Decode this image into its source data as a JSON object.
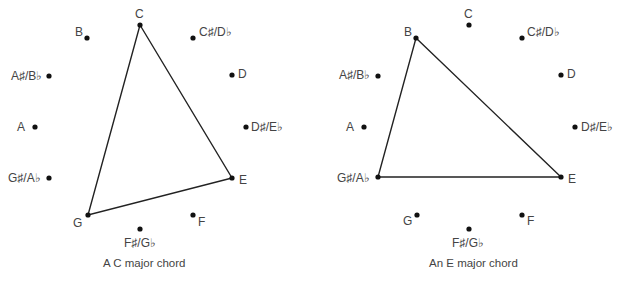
{
  "diagrams": [
    {
      "caption": "A C major chord",
      "chord_root": "C",
      "chord_notes": [
        "C",
        "E",
        "G"
      ],
      "notes": [
        {
          "label": "C",
          "x": 140,
          "y": 25
        },
        {
          "label": "C♯/D♭",
          "x": 193,
          "y": 38
        },
        {
          "label": "D",
          "x": 232,
          "y": 75
        },
        {
          "label": "D♯/E♭",
          "x": 246,
          "y": 127
        },
        {
          "label": "E",
          "x": 232,
          "y": 178
        },
        {
          "label": "F",
          "x": 193,
          "y": 215
        },
        {
          "label": "F♯/G♭",
          "x": 140,
          "y": 229
        },
        {
          "label": "G",
          "x": 88,
          "y": 215
        },
        {
          "label": "G♯/A♭",
          "x": 49,
          "y": 178
        },
        {
          "label": "A",
          "x": 35,
          "y": 127
        },
        {
          "label": "A♯/B♭",
          "x": 49,
          "y": 76
        },
        {
          "label": "B",
          "x": 87,
          "y": 38
        }
      ]
    },
    {
      "caption": "An E major chord",
      "chord_root": "E",
      "chord_notes": [
        "E",
        "G♯/A♭",
        "B"
      ],
      "notes": [
        {
          "label": "C",
          "x": 469,
          "y": 25
        },
        {
          "label": "C♯/D♭",
          "x": 522,
          "y": 38
        },
        {
          "label": "D",
          "x": 561,
          "y": 75
        },
        {
          "label": "D♯/E♭",
          "x": 575,
          "y": 127
        },
        {
          "label": "E",
          "x": 561,
          "y": 177
        },
        {
          "label": "F",
          "x": 522,
          "y": 215
        },
        {
          "label": "F♯/G♭",
          "x": 469,
          "y": 229
        },
        {
          "label": "G",
          "x": 417,
          "y": 215
        },
        {
          "label": "G♯/A♭",
          "x": 378,
          "y": 177
        },
        {
          "label": "A",
          "x": 364,
          "y": 127
        },
        {
          "label": "A♯/B♭",
          "x": 378,
          "y": 76
        },
        {
          "label": "B",
          "x": 416,
          "y": 38
        }
      ]
    }
  ],
  "colors": {
    "line": "#222222",
    "dot": "#111111",
    "text": "#444444"
  }
}
